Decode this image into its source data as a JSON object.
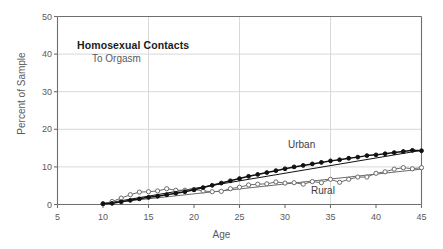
{
  "chart_data": {
    "type": "scatter",
    "title": "Homosexual Contacts",
    "subtitle": "To Orgasm",
    "xlabel": "Age",
    "ylabel": "Percent of Sample",
    "xlim": [
      5,
      45
    ],
    "ylim": [
      0,
      50
    ],
    "xticks": [
      5,
      10,
      15,
      20,
      25,
      30,
      35,
      40,
      45
    ],
    "yticks": [
      0,
      10,
      20,
      30,
      40,
      50
    ],
    "grid": true,
    "grid_x_values": [
      15,
      25,
      35
    ],
    "grid_y_values": [
      10,
      20,
      30,
      40
    ],
    "legend_position": "inline-annotation",
    "x": [
      10,
      11,
      12,
      13,
      14,
      15,
      16,
      17,
      18,
      19,
      20,
      21,
      22,
      23,
      24,
      25,
      26,
      27,
      28,
      29,
      30,
      31,
      32,
      33,
      34,
      35,
      36,
      37,
      38,
      39,
      40,
      41,
      42,
      43,
      44,
      45
    ],
    "series": [
      {
        "name": "Urban",
        "marker": "filled-circle",
        "color": "#111111",
        "values": [
          0.2,
          0.3,
          0.7,
          1.1,
          1.5,
          1.9,
          2.2,
          2.6,
          3.0,
          3.4,
          3.9,
          4.5,
          5.1,
          5.7,
          6.3,
          6.9,
          7.5,
          8.0,
          8.5,
          9.0,
          9.5,
          10.0,
          10.4,
          10.8,
          11.2,
          11.6,
          11.9,
          12.3,
          12.6,
          13.0,
          13.2,
          13.5,
          13.8,
          14.1,
          14.4,
          14.3
        ]
      },
      {
        "name": "Rural",
        "marker": "open-circle",
        "color": "#6b6b6b",
        "values": [
          0.2,
          0.8,
          1.7,
          2.6,
          3.3,
          3.4,
          3.6,
          4.2,
          3.8,
          3.8,
          4.0,
          3.6,
          3.4,
          3.5,
          4.2,
          4.6,
          5.2,
          5.4,
          5.5,
          6.0,
          5.7,
          5.8,
          5.4,
          6.1,
          5.8,
          6.7,
          5.9,
          6.7,
          7.3,
          7.3,
          8.3,
          8.7,
          9.4,
          9.8,
          9.5,
          9.8
        ]
      }
    ],
    "trend_lines": [
      {
        "name": "Urban",
        "x": [
          10,
          45
        ],
        "y": [
          0.2,
          14.4
        ],
        "color": "#111111"
      },
      {
        "name": "Rural",
        "x": [
          10,
          45
        ],
        "y": [
          0.2,
          9.4
        ],
        "color": "#6b6b6b"
      }
    ],
    "annotations": [
      {
        "text": "Urban",
        "x": 30.5,
        "y": 16.0
      },
      {
        "text": "Rural",
        "x": 33.0,
        "y": 4.0
      }
    ]
  },
  "axis": {
    "x_title": "Age",
    "y_title": "Percent of Sample",
    "x_tick_labels": [
      "5",
      "10",
      "15",
      "20",
      "25",
      "30",
      "35",
      "40",
      "45"
    ],
    "y_tick_labels": [
      "0",
      "10",
      "20",
      "30",
      "40",
      "50"
    ]
  },
  "titles": {
    "main": "Homosexual Contacts",
    "sub": "To Orgasm"
  },
  "legend": {
    "urban": "Urban",
    "rural": "Rural"
  },
  "colors": {
    "background": "#ffffff",
    "axis": "#6e6e6e",
    "grid": "#d8d8d8",
    "urban": "#111111",
    "rural": "#6b6b6b",
    "text": "#5a5a5a",
    "title": "#1b1b1b"
  }
}
